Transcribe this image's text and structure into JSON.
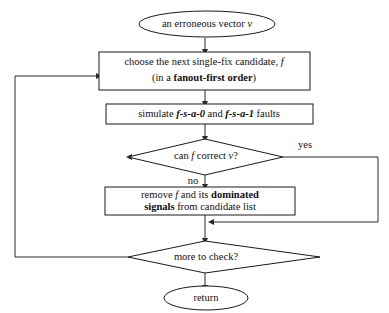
{
  "diagram": {
    "colors": {
      "background": "#ffffff",
      "stroke": "#1a1a1a",
      "connector": "#2b2b2b",
      "text": "#111111"
    },
    "nodes": {
      "start_terminal": {
        "shape": "ellipse",
        "text_plain": "an erroneous vector v",
        "parts": [
          {
            "text": "an erroneous vector ",
            "style": "normal"
          },
          {
            "text": "v",
            "style": "italic"
          }
        ]
      },
      "choose_candidate": {
        "shape": "rectangle",
        "text_plain": "choose the next single-fix candidate, f (in a fanout-first order)",
        "line1": [
          {
            "text": "choose the next single-fix candidate, ",
            "style": "normal"
          },
          {
            "text": "f",
            "style": "italic"
          }
        ],
        "line2": [
          {
            "text": "(in a ",
            "style": "normal"
          },
          {
            "text": "fanout-first order",
            "style": "bold"
          },
          {
            "text": ")",
            "style": "normal"
          }
        ]
      },
      "simulate_faults": {
        "shape": "rectangle",
        "text_plain": "simulate f-s-a-0 and f-s-a-1 faults",
        "parts": [
          {
            "text": "simulate ",
            "style": "normal"
          },
          {
            "text": "f-s-a-0",
            "style": "bold-italic"
          },
          {
            "text": " and ",
            "style": "normal"
          },
          {
            "text": "f-s-a-1",
            "style": "bold-italic"
          },
          {
            "text": " faults",
            "style": "normal"
          }
        ]
      },
      "can_correct_decision": {
        "shape": "diamond",
        "text_plain": "can f correct v?",
        "parts": [
          {
            "text": "can ",
            "style": "normal"
          },
          {
            "text": "f",
            "style": "italic"
          },
          {
            "text": " correct ",
            "style": "normal"
          },
          {
            "text": "v",
            "style": "italic"
          },
          {
            "text": "?",
            "style": "normal"
          }
        ]
      },
      "remove_candidate": {
        "shape": "rectangle",
        "text_plain": "remove f and its dominated signals from candidate list",
        "line1": [
          {
            "text": "remove ",
            "style": "normal"
          },
          {
            "text": "f",
            "style": "italic"
          },
          {
            "text": " and its ",
            "style": "normal"
          },
          {
            "text": "dominated",
            "style": "bold"
          }
        ],
        "line2": [
          {
            "text": "signals",
            "style": "bold"
          },
          {
            "text": " from candidate list",
            "style": "normal"
          }
        ]
      },
      "more_to_check_decision": {
        "shape": "diamond",
        "text_plain": "more to check?",
        "parts": [
          {
            "text": "more to check?",
            "style": "normal"
          }
        ]
      },
      "end_terminal": {
        "shape": "ellipse",
        "text_plain": "return",
        "parts": [
          {
            "text": "return",
            "style": "normal"
          }
        ]
      }
    },
    "edge_labels": {
      "yes": "yes",
      "no": "no"
    },
    "edges": [
      {
        "from": "start_terminal",
        "to": "choose_candidate",
        "label": ""
      },
      {
        "from": "choose_candidate",
        "to": "simulate_faults",
        "label": ""
      },
      {
        "from": "simulate_faults",
        "to": "can_correct_decision",
        "label": ""
      },
      {
        "from": "can_correct_decision",
        "to": "remove_candidate",
        "label": "no"
      },
      {
        "from": "can_correct_decision",
        "to": "more_to_check_decision",
        "label": "yes"
      },
      {
        "from": "remove_candidate",
        "to": "more_to_check_decision",
        "label": ""
      },
      {
        "from": "more_to_check_decision",
        "to": "choose_candidate",
        "label": ""
      },
      {
        "from": "more_to_check_decision",
        "to": "end_terminal",
        "label": ""
      }
    ]
  }
}
